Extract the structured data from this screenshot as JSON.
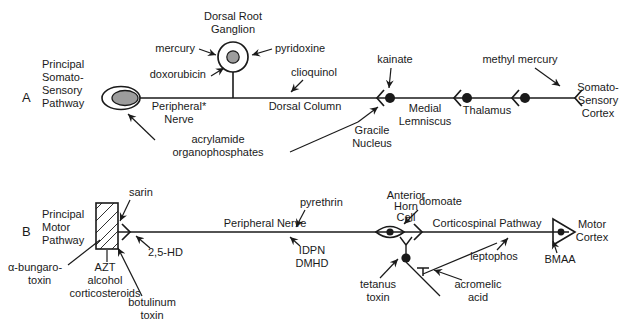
{
  "figure": {
    "background": "#ffffff",
    "ink": "#1a1a1a",
    "cell_fill": "#9d9d9d"
  },
  "panels": [
    {
      "letter": "A",
      "pathway_label": [
        "Principal",
        "Somato-",
        "Sensory",
        "Pathway"
      ],
      "structures": [
        {
          "name": "peripheral-receptor",
          "label": ""
        },
        {
          "name": "peripheral-nerve",
          "label": [
            "Peripheral*",
            "Nerve"
          ]
        },
        {
          "name": "dorsal-root-ganglion",
          "label": [
            "Dorsal Root",
            "Ganglion"
          ]
        },
        {
          "name": "dorsal-column",
          "label": [
            "Dorsal Column"
          ]
        },
        {
          "name": "gracile-nucleus",
          "label": [
            "Gracile",
            "Nucleus"
          ]
        },
        {
          "name": "medial-lemniscus",
          "label": [
            "Medial",
            "Lemniscus"
          ]
        },
        {
          "name": "thalamus",
          "label": [
            "Thalamus"
          ]
        },
        {
          "name": "somatosensory-cortex",
          "label": [
            "Somato-",
            "Sensory",
            "Cortex"
          ]
        }
      ],
      "toxicants": [
        {
          "name": "mercury",
          "label": [
            "mercury"
          ]
        },
        {
          "name": "pyridoxine",
          "label": [
            "pyridoxine"
          ]
        },
        {
          "name": "doxorubicin",
          "label": [
            "doxorubicin"
          ]
        },
        {
          "name": "acrylamide-organophosphates",
          "label": [
            "acrylamide",
            "organophosphates"
          ]
        },
        {
          "name": "clioquinol",
          "label": [
            "clioquinol"
          ]
        },
        {
          "name": "kainate",
          "label": [
            "kainate"
          ]
        },
        {
          "name": "methyl-mercury",
          "label": [
            "methyl mercury"
          ]
        }
      ]
    },
    {
      "letter": "B",
      "pathway_label": [
        "Principal",
        "Motor",
        "Pathway"
      ],
      "structures": [
        {
          "name": "muscle",
          "label": ""
        },
        {
          "name": "peripheral-nerve",
          "label": [
            "Peripheral Nerve"
          ]
        },
        {
          "name": "anterior-horn-cell",
          "label": [
            "Anterior",
            "Horn",
            "Cell"
          ]
        },
        {
          "name": "corticospinal-pathway",
          "label": [
            "Corticospinal Pathway"
          ]
        },
        {
          "name": "motor-cortex",
          "label": [
            "Motor",
            "Cortex"
          ]
        }
      ],
      "toxicants": [
        {
          "name": "sarin",
          "label": [
            "sarin"
          ]
        },
        {
          "name": "alpha-bungarotoxin",
          "label": [
            "α-bungaro-",
            "toxin"
          ]
        },
        {
          "name": "azt-alcohol-corticosteroids",
          "label": [
            "AZT",
            "alcohol",
            "corticosteroids"
          ]
        },
        {
          "name": "botulinum-toxin",
          "label": [
            "botulinum",
            "toxin"
          ]
        },
        {
          "name": "2-5-hd",
          "label": [
            "2,5-HD"
          ]
        },
        {
          "name": "pyrethrin",
          "label": [
            "pyrethrin"
          ]
        },
        {
          "name": "idpn-dmhd",
          "label": [
            "IDPN",
            "DMHD"
          ]
        },
        {
          "name": "domoate",
          "label": [
            "domoate"
          ]
        },
        {
          "name": "tetanus-toxin",
          "label": [
            "tetanus",
            "toxin"
          ]
        },
        {
          "name": "acromelic-acid",
          "label": [
            "acromelic",
            "acid"
          ]
        },
        {
          "name": "leptophos",
          "label": [
            "leptophos"
          ]
        },
        {
          "name": "bmaa",
          "label": [
            "BMAA"
          ]
        }
      ]
    }
  ],
  "text": {
    "a_letter": "A",
    "b_letter": "B",
    "a_path_1": "Principal",
    "a_path_2": "Somato-",
    "a_path_3": "Sensory",
    "a_path_4": "Pathway",
    "b_path_1": "Principal",
    "b_path_2": "Motor",
    "b_path_3": "Pathway",
    "drg_1": "Dorsal Root",
    "drg_2": "Ganglion",
    "mercury": "mercury",
    "pyridoxine": "pyridoxine",
    "doxorubicin": "doxorubicin",
    "periph_nerve_a_1": "Peripheral*",
    "periph_nerve_a_2": "Nerve",
    "acrylamide": "acrylamide",
    "organophosphates": "organophosphates",
    "dorsal_column": "Dorsal Column",
    "clioquinol": "clioquinol",
    "kainate": "kainate",
    "gracile_1": "Gracile",
    "gracile_2": "Nucleus",
    "medial_1": "Medial",
    "medial_2": "Lemniscus",
    "thalamus": "Thalamus",
    "methyl_mercury": "methyl mercury",
    "ss_cortex_1": "Somato-",
    "ss_cortex_2": "Sensory",
    "ss_cortex_3": "Cortex",
    "sarin": "sarin",
    "bungaro_1": "α-bungaro-",
    "bungaro_2": "toxin",
    "azt": "AZT",
    "alcohol": "alcohol",
    "corticosteroids": "corticosteroids",
    "botulinum_1": "botulinum",
    "botulinum_2": "toxin",
    "hd25": "2,5-HD",
    "periph_nerve_b": "Peripheral Nerve",
    "pyrethrin": "pyrethrin",
    "idpn": "IDPN",
    "dmhd": "DMHD",
    "ahc_1": "Anterior",
    "ahc_2": "Horn",
    "ahc_3": "Cell",
    "domoate": "domoate",
    "tetanus_1": "tetanus",
    "tetanus_2": "toxin",
    "acromelic_1": "acromelic",
    "acromelic_2": "acid",
    "corticospinal": "Corticospinal Pathway",
    "leptophos": "leptophos",
    "motor_cortex_1": "Motor",
    "motor_cortex_2": "Cortex",
    "bmaa": "BMAA"
  }
}
